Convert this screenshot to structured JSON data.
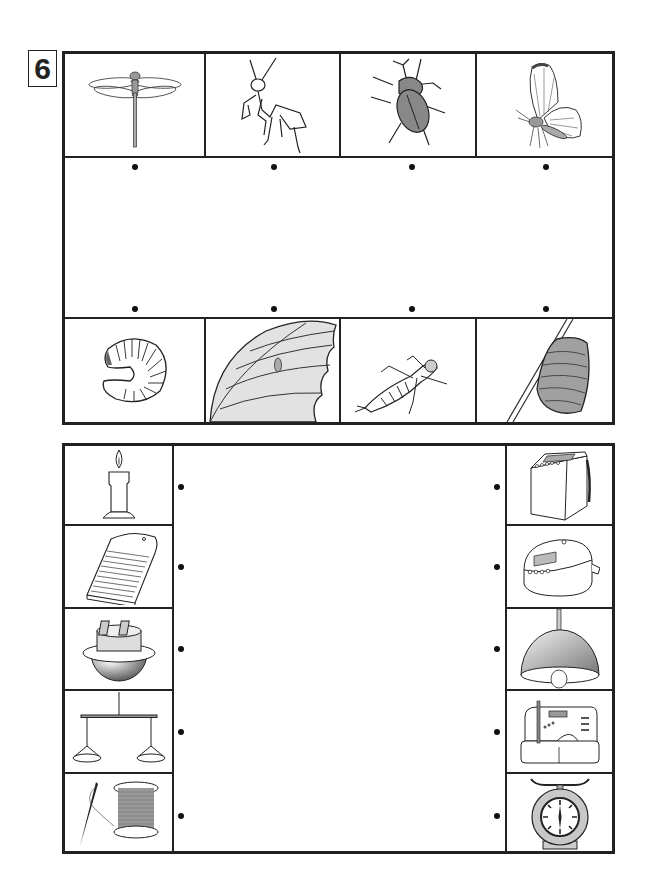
{
  "exercise": {
    "number": "6"
  },
  "top_matching": {
    "adults": [
      {
        "name": "dragonfly",
        "icon": "dragonfly-icon"
      },
      {
        "name": "praying mantis",
        "icon": "mantis-icon"
      },
      {
        "name": "rhinoceros beetle",
        "icon": "beetle-icon"
      },
      {
        "name": "butterfly",
        "icon": "butterfly-icon"
      }
    ],
    "young": [
      {
        "name": "grub larva",
        "icon": "grub-icon"
      },
      {
        "name": "egg on leaf",
        "icon": "egg-on-leaf-icon"
      },
      {
        "name": "dragonfly nymph",
        "icon": "nymph-icon"
      },
      {
        "name": "mantis egg case",
        "icon": "egg-case-icon"
      }
    ]
  },
  "bottom_matching": {
    "old_tools": [
      {
        "name": "candle",
        "icon": "candle-icon"
      },
      {
        "name": "washboard",
        "icon": "washboard-icon"
      },
      {
        "name": "rice cooking pot",
        "icon": "pot-icon"
      },
      {
        "name": "balance scale",
        "icon": "balance-scale-icon"
      },
      {
        "name": "needle and thread",
        "icon": "needle-thread-icon"
      }
    ],
    "modern_tools": [
      {
        "name": "washing machine",
        "icon": "washing-machine-icon"
      },
      {
        "name": "rice cooker",
        "icon": "rice-cooker-icon"
      },
      {
        "name": "pendant lamp",
        "icon": "lamp-icon"
      },
      {
        "name": "sewing machine",
        "icon": "sewing-machine-icon"
      },
      {
        "name": "kitchen scale",
        "icon": "kitchen-scale-icon"
      }
    ]
  },
  "colors": {
    "line": "#222222",
    "fill_gray": "#9a9a9a",
    "light_gray": "#dcdcdc"
  }
}
